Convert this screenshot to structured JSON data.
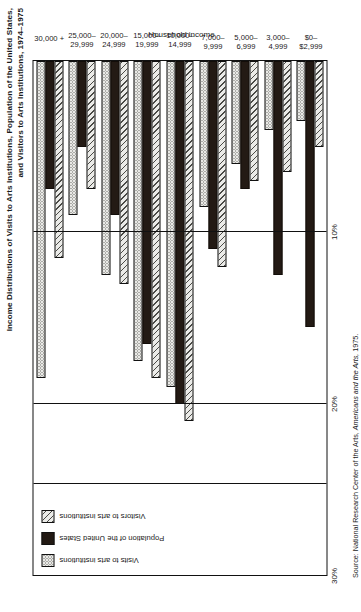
{
  "chart": {
    "title_line1": "Income Distributions of Visits to Arts Institutions, Population of the United States,",
    "title_line2": "and Visitors to Arts Institutions, 1974–1975",
    "axis_title": "Household income",
    "source_prefix": "Source:  National Research Center of the Arts, ",
    "source_italic": "Americans and the Arts,",
    "source_suffix": " 1975.",
    "tick_labels": [
      "30%",
      "20%",
      "10%"
    ]
  },
  "legend": {
    "items": [
      {
        "label": "Visits to arts institutions",
        "key": "visits",
        "swatch": "dotted-swatch"
      },
      {
        "label": "Population of the United States",
        "key": "population",
        "swatch": "solid-black-swatch"
      },
      {
        "label": "Visitors to arts institutions",
        "key": "visitors",
        "swatch": "hatched-swatch"
      }
    ]
  },
  "chart_data": {
    "type": "bar",
    "orientation": "horizontal",
    "title": "Income Distributions of Visits to Arts Institutions, Population of the United States, and Visitors to Arts Institutions, 1974–1975",
    "xlabel": "Household income",
    "ylabel": "",
    "ylim": [
      0,
      30
    ],
    "yticks": [
      0,
      10,
      20,
      30
    ],
    "ytick_labels": [
      "",
      "10%",
      "20%",
      "30%"
    ],
    "grid": true,
    "legend_position": "upper-left",
    "categories": [
      "$0–\n$2,999",
      "3,000–\n4,999",
      "5,000–\n6,999",
      "7,000–\n9,999",
      "10,000–\n14,999",
      "15,000–\n19,999",
      "20,000–\n24,999",
      "25,000–\n29,999",
      "30,000 +"
    ],
    "category_labels": [
      {
        "l1": "$0–",
        "l2": "$2,999"
      },
      {
        "l1": "3,000–",
        "l2": "4,999"
      },
      {
        "l1": "5,000–",
        "l2": "6,999"
      },
      {
        "l1": "7,000–",
        "l2": "9,999"
      },
      {
        "l1": "10,000–",
        "l2": "14,999"
      },
      {
        "l1": "15,000–",
        "l2": "19,999"
      },
      {
        "l1": "20,000–",
        "l2": "24,999"
      },
      {
        "l1": "25,000–",
        "l2": "29,999"
      },
      {
        "l1": "30,000 +",
        "l2": ""
      }
    ],
    "series": [
      {
        "name": "Visits to arts institutions",
        "key": "visits",
        "values": [
          3.5,
          4.0,
          6.0,
          8.5,
          19.0,
          17.5,
          12.5,
          9.0,
          18.5
        ]
      },
      {
        "name": "Population of the United States",
        "key": "population",
        "values": [
          15.5,
          12.5,
          7.5,
          11.0,
          20.0,
          16.5,
          9.0,
          5.0,
          7.5
        ]
      },
      {
        "name": "Visitors to arts institutions",
        "key": "visitors",
        "values": [
          5.0,
          6.5,
          7.0,
          12.0,
          21.0,
          18.5,
          13.0,
          7.5,
          11.5
        ]
      }
    ]
  }
}
